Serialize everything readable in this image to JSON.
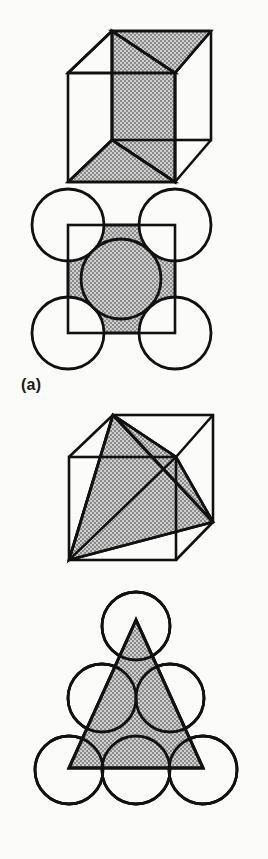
{
  "figure": {
    "background_color": "#fbfbf9",
    "stroke_color": "#111111",
    "shade_fill_color": "#a9a9a9",
    "shade_pattern": "checkerboard-dither",
    "circle_fill_color": "#ffffff",
    "panels": [
      {
        "id": "a",
        "label": "(a)",
        "title_desc": "cube-with-shaded-diagonal-plane-and-square-packing",
        "cube": {
          "name": "cube-diagonal-plane",
          "shaded_face": "rectangular-diagonal-plane",
          "outline_vertices": {
            "back_top_left": [
              112,
              31
            ],
            "back_top_right": [
              211,
              31
            ],
            "front_top_left": [
              68,
              73
            ],
            "front_top_right": [
              175,
              73
            ],
            "front_bottom_left": [
              68,
              182
            ],
            "front_bottom_right": [
              175,
              182
            ],
            "back_bottom_right": [
              211,
              140
            ],
            "back_bottom_left": [
              112,
              140
            ]
          }
        },
        "packing": {
          "name": "square-packing-bcc-110",
          "square": {
            "x": 68,
            "y": 225,
            "width": 107,
            "height": 108
          },
          "corner_circles": [
            {
              "cx": 68,
              "cy": 225,
              "r": 36
            },
            {
              "cx": 175,
              "cy": 225,
              "r": 36
            },
            {
              "cx": 68,
              "cy": 333,
              "r": 36
            },
            {
              "cx": 175,
              "cy": 333,
              "r": 36
            }
          ],
          "center_circle": {
            "cx": 121,
            "cy": 279,
            "r": 40,
            "shaded": true
          },
          "circle_count": 5
        }
      },
      {
        "id": "b",
        "label": "(b)",
        "title_desc": "cube-with-inscribed-tetrahedron-and-triangular-packing",
        "cube": {
          "name": "cube-inscribed-tetrahedron",
          "shaded_solid": "tetrahedron",
          "outline_vertices": {
            "back_top_left": [
              113,
              415
            ],
            "back_top_right": [
              213,
              415
            ],
            "front_top_left": [
              69,
              457
            ],
            "front_top_right": [
              176,
              457
            ],
            "front_bottom_left": [
              69,
              560
            ],
            "front_bottom_right": [
              176,
              560
            ],
            "back_bottom_right": [
              213,
              522
            ],
            "back_bottom_left": [
              113,
              522
            ]
          },
          "tetra_vertices": [
            [
              113,
              415
            ],
            [
              69,
              560
            ],
            [
              213,
              522
            ],
            [
              176,
              457
            ]
          ]
        },
        "packing": {
          "name": "triangular-packing-fcc-111",
          "triangle": {
            "apex": [
              136,
              620
            ],
            "left": [
              69,
              768
            ],
            "right": [
              203,
              768
            ]
          },
          "rows": [
            {
              "row": 1,
              "circles": [
                {
                  "cx": 136,
                  "cy": 626,
                  "r": 34
                }
              ]
            },
            {
              "row": 2,
              "circles": [
                {
                  "cx": 102,
                  "cy": 698,
                  "r": 34
                },
                {
                  "cx": 170,
                  "cy": 698,
                  "r": 34
                }
              ]
            },
            {
              "row": 3,
              "circles": [
                {
                  "cx": 69,
                  "cy": 770,
                  "r": 34
                },
                {
                  "cx": 136,
                  "cy": 770,
                  "r": 34
                },
                {
                  "cx": 203,
                  "cy": 770,
                  "r": 34
                }
              ]
            }
          ],
          "circle_count": 6
        }
      }
    ]
  }
}
